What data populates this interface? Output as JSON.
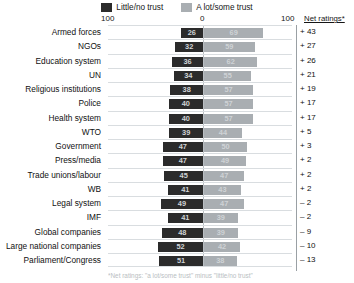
{
  "legend": {
    "items": [
      {
        "label": "Little/no trust",
        "color": "#2b2b2b",
        "key": "little_no_trust"
      },
      {
        "label": "A lot/some trust",
        "color": "#a9aeb2",
        "key": "a_lot_some_trust"
      }
    ]
  },
  "axis": {
    "left_tick": "100",
    "mid_tick": "0",
    "right_tick": "100"
  },
  "net_header": "Net ratings*",
  "footnote": "*Net ratings: \"a lot/some trust\" minus \"little/no trust\"",
  "colors": {
    "dark": "#2b2b2b",
    "light": "#a9aeb2",
    "gridline": "#d9dde0",
    "axis_rule": "#9aa0a4",
    "text": "#111111"
  },
  "chart_data": {
    "type": "bar",
    "title": "",
    "subtype": "diverging-stacked-bar",
    "xlabel": "",
    "ylabel": "",
    "xlim": [
      -100,
      100
    ],
    "grid": true,
    "legend_position": "top-center",
    "categories": [
      "Armed forces",
      "NGOs",
      "Education system",
      "UN",
      "Religious institutions",
      "Police",
      "Health system",
      "WTO",
      "Government",
      "Press/media",
      "Trade unions/labour",
      "WB",
      "Legal system",
      "IMF",
      "Global companies",
      "Large national companies",
      "Parliament/Congress"
    ],
    "series": [
      {
        "name": "Little/no trust",
        "color": "#2b2b2b",
        "direction": "left",
        "values": [
          26,
          32,
          36,
          34,
          38,
          40,
          40,
          39,
          47,
          47,
          45,
          41,
          49,
          41,
          48,
          52,
          51
        ]
      },
      {
        "name": "A lot/some trust",
        "color": "#a9aeb2",
        "direction": "right",
        "values": [
          69,
          59,
          62,
          55,
          57,
          57,
          57,
          44,
          50,
          49,
          47,
          43,
          47,
          39,
          39,
          42,
          38
        ]
      }
    ],
    "net_ratings": [
      "+ 43",
      "+ 27",
      "+ 26",
      "+ 21",
      "+ 19",
      "+ 17",
      "+ 17",
      "+ 5",
      "+ 3",
      "+ 2",
      "+ 2",
      "+ 2",
      "– 2",
      "– 2",
      "– 9",
      "– 10",
      "– 13"
    ]
  }
}
